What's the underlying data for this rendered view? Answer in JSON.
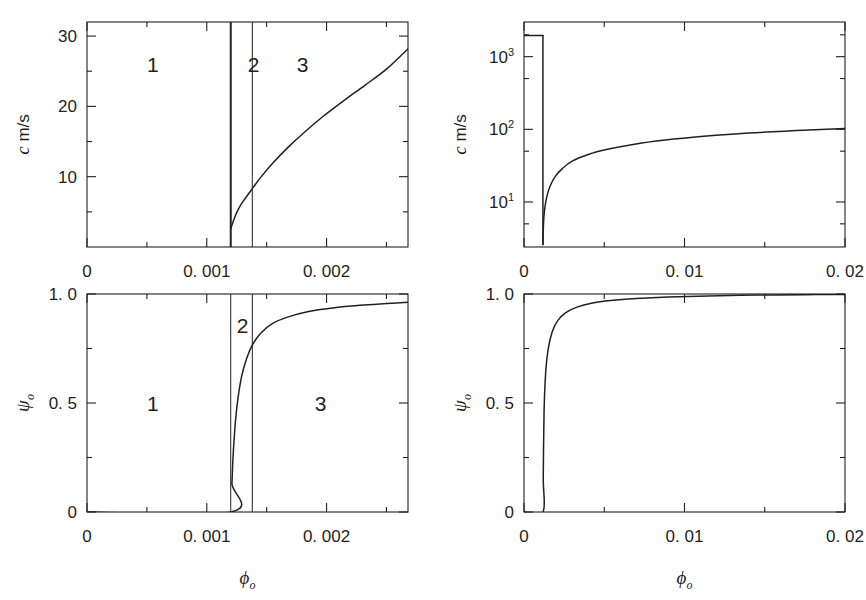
{
  "figure": {
    "background": "#ffffff",
    "ink": "#231f20",
    "panel_count": 4
  },
  "chart_data": [
    {
      "id": "top-left",
      "type": "line",
      "title": "",
      "xlabel": "ϕₒ",
      "ylabel": "c  m/s",
      "xlim": [
        0,
        0.00268
      ],
      "ylim": [
        0,
        32
      ],
      "xscale": "linear",
      "yscale": "linear",
      "grid": false,
      "legend": "none",
      "xticks_major": [
        0,
        0.001,
        0.002
      ],
      "xticklabels": [
        "0",
        "0. 001",
        "0. 002"
      ],
      "xticks_minor": [
        0.0005,
        0.0015,
        0.0025
      ],
      "yticks_major": [
        10,
        20,
        30
      ],
      "yticklabels": [
        "10",
        "20",
        "30"
      ],
      "yticks_minor": [
        5,
        15,
        25
      ],
      "annotations": [
        {
          "text": "1",
          "x": 0.00055,
          "y": 26
        },
        {
          "text": "2",
          "x": 0.00139,
          "y": 26
        },
        {
          "text": "3",
          "x": 0.0018,
          "y": 26
        }
      ],
      "region_boundaries": [
        {
          "x": 0.0012,
          "style": "thick"
        },
        {
          "x": 0.00138,
          "style": "thin"
        }
      ],
      "series": [
        {
          "name": "c",
          "x": [
            0.0012,
            0.00122,
            0.00125,
            0.00128,
            0.00132,
            0.00138,
            0.00145,
            0.00155,
            0.00168,
            0.00182,
            0.00198,
            0.00215,
            0.00232,
            0.0025,
            0.00268
          ],
          "values": [
            2.6,
            3.6,
            4.9,
            5.9,
            6.9,
            8.3,
            9.9,
            11.9,
            14.2,
            16.4,
            18.7,
            20.9,
            23.0,
            25.3,
            28.2
          ]
        }
      ]
    },
    {
      "id": "bottom-left",
      "type": "line",
      "title": "",
      "xlabel": "ϕₒ",
      "ylabel": "ψₒ",
      "xlim": [
        0,
        0.00268
      ],
      "ylim": [
        0,
        1.0
      ],
      "xscale": "linear",
      "yscale": "linear",
      "grid": false,
      "legend": "none",
      "xticks_major": [
        0,
        0.001,
        0.002
      ],
      "xticklabels": [
        "0",
        "0. 001",
        "0. 002"
      ],
      "xticks_minor": [
        0.0005,
        0.0015,
        0.0025
      ],
      "yticks_major": [
        0,
        0.5,
        1.0
      ],
      "yticklabels": [
        "0",
        "0. 5",
        "1. 0"
      ],
      "yticks_minor": [
        0.25,
        0.75
      ],
      "annotations": [
        {
          "text": "1",
          "x": 0.00055,
          "y": 0.5
        },
        {
          "text": "2",
          "x": 0.0013,
          "y": 0.86
        },
        {
          "text": "3",
          "x": 0.00195,
          "y": 0.5
        }
      ],
      "region_boundaries": [
        {
          "x": 0.0012,
          "style": "thin"
        },
        {
          "x": 0.00138,
          "style": "thin"
        }
      ],
      "series": [
        {
          "name": "psi",
          "x": [
            0.0,
            0.0012,
            0.00121,
            0.00122,
            0.00124,
            0.00126,
            0.00129,
            0.00133,
            0.00138,
            0.00145,
            0.00155,
            0.00168,
            0.00185,
            0.00205,
            0.00228,
            0.0025,
            0.00268
          ],
          "values": [
            0.0,
            0.0,
            0.13,
            0.26,
            0.42,
            0.52,
            0.62,
            0.7,
            0.765,
            0.82,
            0.865,
            0.895,
            0.92,
            0.936,
            0.948,
            0.956,
            0.962
          ]
        }
      ]
    },
    {
      "id": "top-right",
      "type": "line",
      "title": "",
      "xlabel": "ϕₒ",
      "ylabel": "c  m/s",
      "xlim": [
        0,
        0.02
      ],
      "ylim": [
        2.4,
        3000
      ],
      "xscale": "linear",
      "yscale": "log",
      "grid": false,
      "legend": "none",
      "xticks_major": [
        0,
        0.01,
        0.02
      ],
      "xticklabels": [
        "0",
        "0. 01",
        "0. 02"
      ],
      "xticks_minor": [
        0.005,
        0.015
      ],
      "yticks_major": [
        10,
        100,
        1000
      ],
      "yticklabels": [
        "10¹",
        "10²",
        "10³"
      ],
      "yticks_minor": [
        5,
        50,
        500,
        2000
      ],
      "annotations": [],
      "series": [
        {
          "name": "c-branch-upper",
          "x": [
            0.0,
            0.00118
          ],
          "values": [
            1950,
            1950
          ]
        },
        {
          "name": "c-branch-lower",
          "x": [
            0.00118,
            0.0012,
            0.00124,
            0.00132,
            0.00145,
            0.00165,
            0.00195,
            0.0024,
            0.003,
            0.004,
            0.0052,
            0.0068,
            0.0088,
            0.0112,
            0.014,
            0.017,
            0.02
          ],
          "values": [
            2.6,
            4.1,
            6.2,
            9.0,
            12.5,
            17.0,
            22.5,
            29.0,
            36.5,
            45.0,
            53.0,
            62.0,
            71.0,
            80.0,
            89.0,
            96.0,
            103.0
          ]
        }
      ]
    },
    {
      "id": "bottom-right",
      "type": "line",
      "title": "",
      "xlabel": "ϕₒ",
      "ylabel": "ψₒ",
      "xlim": [
        0,
        0.02
      ],
      "ylim": [
        0,
        1.0
      ],
      "xscale": "linear",
      "yscale": "linear",
      "grid": false,
      "legend": "none",
      "xticks_major": [
        0,
        0.01,
        0.02
      ],
      "xticklabels": [
        "0",
        "0. 01",
        "0. 02"
      ],
      "xticks_minor": [
        0.005,
        0.015
      ],
      "yticks_major": [
        0,
        0.5,
        1.0
      ],
      "yticklabels": [
        "0",
        "0. 5",
        "1. 0"
      ],
      "yticks_minor": [
        0.25,
        0.75
      ],
      "annotations": [],
      "series": [
        {
          "name": "psi",
          "x": [
            0.0,
            0.00118,
            0.0012,
            0.00125,
            0.00135,
            0.0015,
            0.00175,
            0.0021,
            0.0026,
            0.0033,
            0.0042,
            0.0054,
            0.007,
            0.009,
            0.0115,
            0.0145,
            0.0175,
            0.02
          ],
          "values": [
            0.0,
            0.0,
            0.16,
            0.46,
            0.64,
            0.745,
            0.825,
            0.878,
            0.915,
            0.94,
            0.958,
            0.97,
            0.979,
            0.986,
            0.991,
            0.995,
            0.997,
            0.998
          ]
        }
      ]
    }
  ]
}
